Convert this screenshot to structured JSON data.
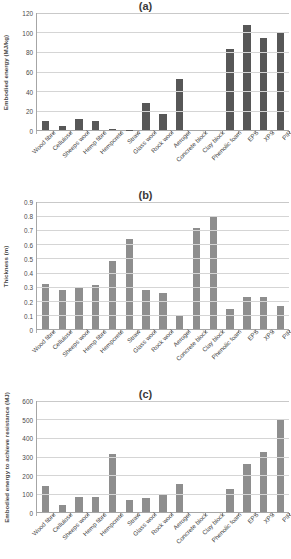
{
  "figure": {
    "categories": [
      "Wood fibre",
      "Cellulose",
      "Sheeps wool",
      "Hemp fibre",
      "Hempcrete",
      "Straw",
      "Glass wool",
      "Rock wool",
      "Aerogel",
      "Concrete block",
      "Clay block",
      "Phenolic foam",
      "EPS",
      "XPS",
      "PIR"
    ]
  },
  "panels": [
    {
      "label": "(a)",
      "ylabel": "Embodied energy (MJ/kg)",
      "yticks": [
        "0",
        "20",
        "40",
        "60",
        "80",
        "100",
        "120"
      ]
    },
    {
      "label": "(b)",
      "ylabel": "Thickness (m)",
      "yticks": [
        "0",
        "0.1",
        "0.2",
        "0.3",
        "0.4",
        "0.5",
        "0.6",
        "0.7",
        "0.8",
        "0.9"
      ]
    },
    {
      "label": "(c)",
      "ylabel": "Embodied energy to achieve resistance (MJ)",
      "yticks": [
        "0",
        "100",
        "200",
        "300",
        "400",
        "500",
        "600"
      ]
    }
  ],
  "chart_data": [
    {
      "type": "bar",
      "title": "(a)",
      "xlabel": "",
      "ylabel": "Embodied energy (MJ/kg)",
      "ylim": [
        0,
        120
      ],
      "ytick_values": [
        0,
        20,
        40,
        60,
        80,
        100,
        120
      ],
      "grid": true,
      "legend": "none",
      "bar_color": "#575757",
      "categories": [
        "Wood fibre",
        "Cellulose",
        "Sheeps wool",
        "Hemp fibre",
        "Hempcrete",
        "Straw",
        "Glass wool",
        "Rock wool",
        "Aerogel",
        "Concrete block",
        "Clay block",
        "Phenolic foam",
        "EPS",
        "XPS",
        "PIR"
      ],
      "values": [
        9.5,
        4.5,
        11.5,
        9.5,
        1.5,
        0.5,
        27.5,
        16.0,
        52.5,
        0.0,
        0.0,
        83.0,
        107.5,
        94.0,
        100.5
      ]
    },
    {
      "type": "bar",
      "title": "(b)",
      "xlabel": "",
      "ylabel": "Thickness (m)",
      "ylim": [
        0,
        0.9
      ],
      "ytick_values": [
        0,
        0.1,
        0.2,
        0.3,
        0.4,
        0.5,
        0.6,
        0.7,
        0.8,
        0.9
      ],
      "grid": true,
      "legend": "none",
      "bar_color": "#8e8e8e",
      "categories": [
        "Wood fibre",
        "Cellulose",
        "Sheeps wool",
        "Hemp fibre",
        "Hempcrete",
        "Straw",
        "Glass wool",
        "Rock wool",
        "Aerogel",
        "Concrete block",
        "Clay block",
        "Phenolic foam",
        "EPS",
        "XPS",
        "PIR"
      ],
      "values": [
        0.32,
        0.28,
        0.3,
        0.31,
        0.48,
        0.635,
        0.28,
        0.255,
        0.095,
        0.715,
        0.8,
        0.14,
        0.23,
        0.225,
        0.165
      ]
    },
    {
      "type": "bar",
      "title": "(c)",
      "xlabel": "",
      "ylabel": "Embodied energy to achieve resistance (MJ)",
      "ylim": [
        0,
        600
      ],
      "ytick_values": [
        0,
        100,
        200,
        300,
        400,
        500,
        600
      ],
      "grid": true,
      "legend": "none",
      "bar_color": "#8e8e8e",
      "categories": [
        "Wood fibre",
        "Cellulose",
        "Sheeps wool",
        "Hemp fibre",
        "Hempcrete",
        "Straw",
        "Glass wool",
        "Rock wool",
        "Aerogel",
        "Concrete block",
        "Clay block",
        "Phenolic foam",
        "EPS",
        "XPS",
        "PIR"
      ],
      "values": [
        139,
        38,
        83,
        82,
        314,
        65,
        76,
        90,
        150,
        0,
        0,
        124,
        257,
        324,
        505
      ]
    }
  ]
}
